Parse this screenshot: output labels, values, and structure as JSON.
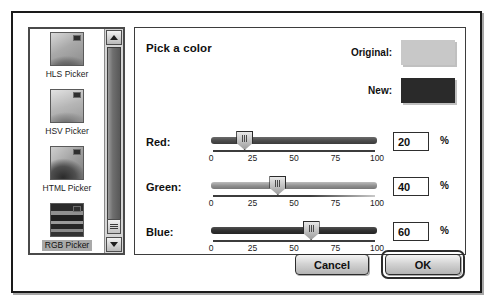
{
  "dialog": {
    "panel_title": "Pick a color"
  },
  "sidebar": {
    "items": [
      {
        "label": "HLS Picker",
        "thumb": "hls-gradient-thumbnail",
        "selected": false
      },
      {
        "label": "HSV Picker",
        "thumb": "hsv-gradient-thumbnail",
        "selected": false
      },
      {
        "label": "HTML Picker",
        "thumb": "html-gradient-thumbnail",
        "selected": false
      },
      {
        "label": "RGB Picker",
        "thumb": "rgb-stripes-thumbnail",
        "selected": true
      }
    ],
    "scrollbar": {
      "up_arrow_icon": "triangle-up-icon",
      "down_arrow_icon": "triangle-down-icon",
      "grip_icon": "resize-grip-icon"
    }
  },
  "swatches": {
    "original_label": "Original:",
    "original_color": "#c8c8c8",
    "new_label": "New:",
    "new_color": "#2a2a2a"
  },
  "sliders": [
    {
      "label": "Red:",
      "value": "20",
      "unit": "%",
      "percent": 20,
      "ticks": [
        "0",
        "25",
        "50",
        "75",
        "100"
      ],
      "tick_values": [
        0,
        25,
        50,
        75,
        100
      ],
      "min": 0,
      "max": 100
    },
    {
      "label": "Green:",
      "value": "40",
      "unit": "%",
      "percent": 40,
      "ticks": [
        "0",
        "25",
        "50",
        "75",
        "100"
      ],
      "tick_values": [
        0,
        25,
        50,
        75,
        100
      ],
      "min": 0,
      "max": 100
    },
    {
      "label": "Blue:",
      "value": "60",
      "unit": "%",
      "percent": 60,
      "ticks": [
        "0",
        "25",
        "50",
        "75",
        "100"
      ],
      "tick_values": [
        0,
        25,
        50,
        75,
        100
      ],
      "min": 0,
      "max": 100
    }
  ],
  "buttons": {
    "cancel_label": "Cancel",
    "ok_label": "OK"
  }
}
